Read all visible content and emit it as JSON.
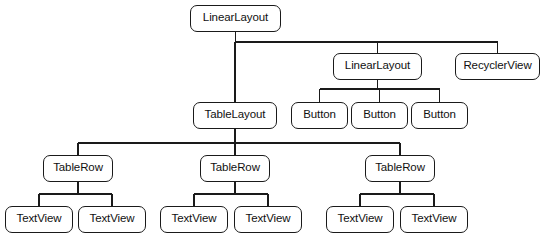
{
  "diagram": {
    "type": "view-hierarchy-tree",
    "colors": {
      "background": "#ffffff",
      "node_border": "#1a1a1a",
      "node_fill": "#ffffff",
      "text": "#111111",
      "edge": "#1a1a1a"
    },
    "nodes": [
      {
        "id": "root-linearlayout",
        "label": "LinearLayout",
        "x": 190,
        "y": 5,
        "w": 91,
        "h": 27,
        "level": 0
      },
      {
        "id": "linearlayout-2",
        "label": "LinearLayout",
        "x": 333,
        "y": 53,
        "w": 89,
        "h": 27,
        "level": 1
      },
      {
        "id": "recyclerview",
        "label": "RecyclerView",
        "x": 455,
        "y": 53,
        "w": 85,
        "h": 27,
        "level": 1
      },
      {
        "id": "tablelayout",
        "label": "TableLayout",
        "x": 193,
        "y": 102,
        "w": 84,
        "h": 27,
        "level": 2
      },
      {
        "id": "button-1",
        "label": "Button",
        "x": 291,
        "y": 102,
        "w": 57,
        "h": 27,
        "level": 2
      },
      {
        "id": "button-2",
        "label": "Button",
        "x": 351,
        "y": 102,
        "w": 57,
        "h": 27,
        "level": 2
      },
      {
        "id": "button-3",
        "label": "Button",
        "x": 411,
        "y": 102,
        "w": 57,
        "h": 27,
        "level": 2
      },
      {
        "id": "tablerow-1",
        "label": "TableRow",
        "x": 43,
        "y": 155,
        "w": 70,
        "h": 27,
        "level": 3
      },
      {
        "id": "tablerow-2",
        "label": "TableRow",
        "x": 200,
        "y": 155,
        "w": 70,
        "h": 27,
        "level": 3
      },
      {
        "id": "tablerow-3",
        "label": "TableRow",
        "x": 365,
        "y": 155,
        "w": 70,
        "h": 27,
        "level": 3
      },
      {
        "id": "textview-1",
        "label": "TextView",
        "x": 5,
        "y": 206,
        "w": 68,
        "h": 27,
        "level": 4
      },
      {
        "id": "textview-2",
        "label": "TextView",
        "x": 78,
        "y": 206,
        "w": 68,
        "h": 27,
        "level": 4
      },
      {
        "id": "textview-3",
        "label": "TextView",
        "x": 160,
        "y": 206,
        "w": 68,
        "h": 27,
        "level": 4
      },
      {
        "id": "textview-4",
        "label": "TextView",
        "x": 234,
        "y": 206,
        "w": 68,
        "h": 27,
        "level": 4
      },
      {
        "id": "textview-5",
        "label": "TextView",
        "x": 326,
        "y": 206,
        "w": 68,
        "h": 27,
        "level": 4
      },
      {
        "id": "textview-6",
        "label": "TextView",
        "x": 400,
        "y": 206,
        "w": 68,
        "h": 27,
        "level": 4
      }
    ],
    "edges": [
      {
        "from": "root-linearlayout",
        "to": "tablelayout",
        "style": "orthogonal-bus",
        "bus_y": 42
      },
      {
        "from": "root-linearlayout",
        "to": "linearlayout-2",
        "style": "orthogonal-bus",
        "bus_y": 42
      },
      {
        "from": "root-linearlayout",
        "to": "recyclerview",
        "style": "orthogonal-bus",
        "bus_y": 42
      },
      {
        "from": "linearlayout-2",
        "to": "button-1",
        "style": "orthogonal-bus",
        "bus_y": 89
      },
      {
        "from": "linearlayout-2",
        "to": "button-2",
        "style": "orthogonal-bus",
        "bus_y": 89
      },
      {
        "from": "linearlayout-2",
        "to": "button-3",
        "style": "orthogonal-bus",
        "bus_y": 89
      },
      {
        "from": "tablelayout",
        "to": "tablerow-1",
        "style": "orthogonal-bus",
        "bus_y": 143
      },
      {
        "from": "tablelayout",
        "to": "tablerow-2",
        "style": "orthogonal-bus",
        "bus_y": 143
      },
      {
        "from": "tablelayout",
        "to": "tablerow-3",
        "style": "orthogonal-bus",
        "bus_y": 143
      },
      {
        "from": "tablerow-1",
        "to": "textview-1",
        "style": "orthogonal-bus",
        "bus_y": 194
      },
      {
        "from": "tablerow-1",
        "to": "textview-2",
        "style": "orthogonal-bus",
        "bus_y": 194
      },
      {
        "from": "tablerow-2",
        "to": "textview-3",
        "style": "orthogonal-bus",
        "bus_y": 194
      },
      {
        "from": "tablerow-2",
        "to": "textview-4",
        "style": "orthogonal-bus",
        "bus_y": 194
      },
      {
        "from": "tablerow-3",
        "to": "textview-5",
        "style": "orthogonal-bus",
        "bus_y": 194
      },
      {
        "from": "tablerow-3",
        "to": "textview-6",
        "style": "orthogonal-bus",
        "bus_y": 194
      }
    ]
  }
}
